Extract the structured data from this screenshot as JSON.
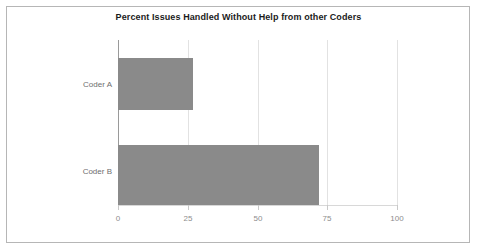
{
  "chart_data": {
    "type": "bar",
    "orientation": "horizontal",
    "title": "Percent Issues Handled Without Help from other Coders",
    "xlabel": "",
    "ylabel": "",
    "categories": [
      "Coder A",
      "Coder B"
    ],
    "values": [
      27,
      72
    ],
    "xlim": [
      0,
      100
    ],
    "xticks": [
      0,
      25,
      50,
      75,
      100
    ],
    "xtick_labels": [
      "0",
      "25",
      "50",
      "75",
      "100"
    ],
    "grid": true,
    "legend": false,
    "bar_color": "#8a8a8a",
    "gridline_color": "#e2e2e2",
    "axis_color": "#9a9a9a",
    "title_color": "#1b1b1b",
    "label_color": "#6e6e6e",
    "tick_label_color": "#8d8d8d",
    "background_color": "#ffffff",
    "border_color": "#b6b6b6"
  },
  "ticks": [
    {
      "label": "0"
    },
    {
      "label": "25"
    },
    {
      "label": "50"
    },
    {
      "label": "75"
    },
    {
      "label": "100"
    }
  ],
  "bars": [
    {
      "label": "Coder A",
      "value": "27"
    },
    {
      "label": "Coder B",
      "value": "72"
    }
  ]
}
